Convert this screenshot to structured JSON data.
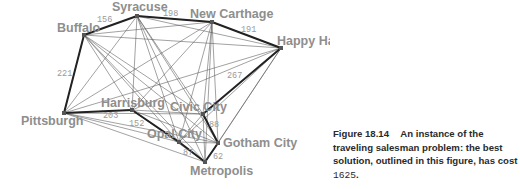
{
  "diagram": {
    "colors": {
      "thin_edge": "#555555",
      "tour_edge": "#222222",
      "city_label": "#8e8e8e",
      "edge_label": "#9a9a9a",
      "node": "#555555"
    },
    "cities": [
      {
        "id": "syracuse",
        "name": "Syracuse",
        "x": 137,
        "y": 16,
        "lx": 112,
        "ly": 11
      },
      {
        "id": "buffalo",
        "name": "Buffalo",
        "x": 84,
        "y": 35,
        "lx": 57,
        "ly": 32
      },
      {
        "id": "new-carthage",
        "name": "New Carthage",
        "x": 212,
        "y": 22,
        "lx": 190,
        "ly": 18
      },
      {
        "id": "happy-harbor",
        "name": "Happy Harbor",
        "x": 281,
        "y": 48,
        "lx": 277,
        "ly": 45
      },
      {
        "id": "pittsburgh",
        "name": "Pittsburgh",
        "x": 64,
        "y": 113,
        "lx": 21,
        "ly": 125
      },
      {
        "id": "harrisburg",
        "name": "Harrisburg",
        "x": 132,
        "y": 110,
        "lx": 101,
        "ly": 107
      },
      {
        "id": "civic-city",
        "name": "Civic City",
        "x": 203,
        "y": 114,
        "lx": 170,
        "ly": 111
      },
      {
        "id": "opal-city",
        "name": "Opal City",
        "x": 179,
        "y": 142,
        "lx": 147,
        "ly": 138
      },
      {
        "id": "gotham-city",
        "name": "Gotham City",
        "x": 218,
        "y": 143,
        "lx": 223,
        "ly": 147
      },
      {
        "id": "metropolis",
        "name": "Metropolis",
        "x": 205,
        "y": 162,
        "lx": 190,
        "ly": 175
      }
    ],
    "tour": [
      {
        "from": "buffalo",
        "to": "syracuse",
        "cost": "156",
        "lx": 97,
        "ly": 22
      },
      {
        "from": "syracuse",
        "to": "new-carthage",
        "cost": "198",
        "lx": 163,
        "ly": 16
      },
      {
        "from": "new-carthage",
        "to": "happy-harbor",
        "cost": "191",
        "lx": 241,
        "ly": 32
      },
      {
        "from": "happy-harbor",
        "to": "civic-city",
        "cost": "267",
        "lx": 227,
        "ly": 78
      },
      {
        "from": "civic-city",
        "to": "gotham-city",
        "cost": "88",
        "lx": 209,
        "ly": 127
      },
      {
        "from": "gotham-city",
        "to": "metropolis",
        "cost": "62",
        "lx": 213,
        "ly": 159
      },
      {
        "from": "metropolis",
        "to": "opal-city",
        "cost": "87",
        "lx": 183,
        "ly": 155
      },
      {
        "from": "opal-city",
        "to": "harrisburg",
        "cost": "152",
        "lx": 129,
        "ly": 126
      },
      {
        "from": "harrisburg",
        "to": "pittsburgh",
        "cost": "203",
        "lx": 103,
        "ly": 118
      },
      {
        "from": "pittsburgh",
        "to": "buffalo",
        "cost": "221",
        "lx": 57,
        "ly": 76
      }
    ],
    "total_cost": "1625"
  },
  "caption": {
    "figure_number": "Figure 18.14",
    "text": "An instance of the traveling salesman problem: the best solution, outlined in this figure, has cost",
    "cost": "1625",
    "end": "."
  }
}
